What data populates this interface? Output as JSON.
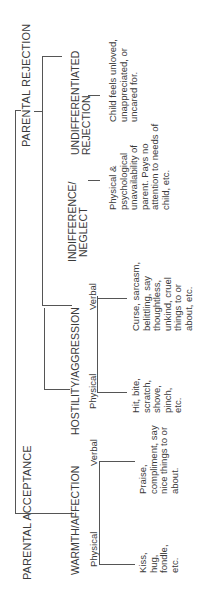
{
  "diagram": {
    "root": {
      "rejection_label": "PARENTAL REJECTION",
      "acceptance_label": "PARENTAL ACCEPTANCE"
    },
    "rejection": {
      "undifferentiated": {
        "label_line1": "UNDIFFERENTIATED",
        "label_line2": "REJECTION",
        "description": "Child feels unloved, unappreciated, or uncared for."
      },
      "indifference": {
        "label_line1": "INDIFFERENCE/",
        "label_line2": "NEGLECT",
        "description": "Physical & psychological unavailability of parent. Pays no attention to needs of child, etc."
      },
      "hostility": {
        "label": "HOSTILITY/AGGRESSION",
        "verbal_label": "Verbal",
        "verbal_description": "Curse, sarcasm, belittling, say thoughtless, unkind, cruel things to or about, etc.",
        "physical_label": "Physical",
        "physical_description": "Hit, bite, scratch, shove, pinch, etc."
      }
    },
    "acceptance": {
      "warmth": {
        "label": "WARMTH/AFFECTION",
        "verbal_label": "Verbal",
        "verbal_description": "Praise, compliment, say nice things to or about.",
        "physical_label": "Physical",
        "physical_description": "Kiss, hug, fondle, etc."
      }
    }
  }
}
